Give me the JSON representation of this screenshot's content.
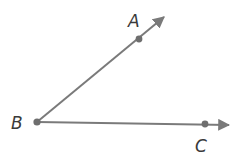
{
  "diagram": {
    "type": "angle",
    "vertex": {
      "label": "B",
      "x": 37,
      "y": 122
    },
    "rays": [
      {
        "name": "BA",
        "point": {
          "label": "A",
          "x": 139,
          "y": 39
        },
        "end": {
          "x": 168,
          "y": 14
        }
      },
      {
        "name": "BC",
        "point": {
          "label": "C",
          "x": 205,
          "y": 124
        },
        "end": {
          "x": 234,
          "y": 125
        }
      }
    ],
    "labels": {
      "A": "A",
      "B": "B",
      "C": "C"
    },
    "colors": {
      "line": "#7a7a7a",
      "point": "#6e6e6e",
      "text": "#3a3a3a"
    }
  }
}
